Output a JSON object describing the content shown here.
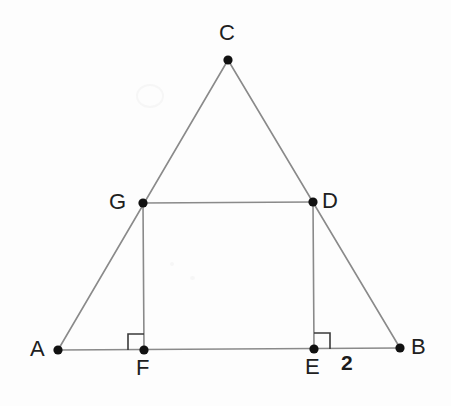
{
  "figure": {
    "canvas": {
      "width": 451,
      "height": 406
    },
    "background_color": "#fdfdfd",
    "line_color": "#8a8a8a",
    "marker_color": "#111111",
    "label_color": "#202020",
    "stroke_width": 1.6,
    "point_radius": 4.6
  },
  "points": [
    {
      "id": "A",
      "label": "A",
      "x": 58,
      "y": 350,
      "label_x": 30,
      "label_y": 338
    },
    {
      "id": "B",
      "label": "B",
      "x": 400,
      "y": 348,
      "label_x": 411,
      "label_y": 336
    },
    {
      "id": "C",
      "label": "C",
      "x": 228,
      "y": 60,
      "label_x": 219,
      "label_y": 22
    },
    {
      "id": "D",
      "label": "D",
      "x": 313,
      "y": 202,
      "label_x": 322,
      "label_y": 190
    },
    {
      "id": "E",
      "label": "E",
      "x": 314,
      "y": 349,
      "label_x": 305,
      "label_y": 356
    },
    {
      "id": "F",
      "label": "F",
      "x": 144,
      "y": 350,
      "label_x": 136,
      "label_y": 357
    },
    {
      "id": "G",
      "label": "G",
      "x": 143,
      "y": 203,
      "label_x": 109,
      "label_y": 191
    }
  ],
  "segments": [
    {
      "id": "AC",
      "from": "A",
      "to": "C",
      "name": "segment-ac"
    },
    {
      "id": "CB",
      "from": "C",
      "to": "B",
      "name": "segment-cb"
    },
    {
      "id": "AB",
      "from": "A",
      "to": "B",
      "name": "segment-ab"
    },
    {
      "id": "GD",
      "from": "G",
      "to": "D",
      "name": "segment-gd"
    },
    {
      "id": "GF",
      "from": "G",
      "to": "F",
      "name": "segment-gf"
    },
    {
      "id": "DE",
      "from": "D",
      "to": "E",
      "name": "segment-de"
    }
  ],
  "right_angle_marks": [
    {
      "id": "at-F",
      "vertex": "F",
      "size": 16,
      "dir_x": -1,
      "dir_y": -1,
      "name": "right-angle-mark-f"
    },
    {
      "id": "at-E",
      "vertex": "E",
      "size": 16,
      "dir_x": 1,
      "dir_y": -1,
      "name": "right-angle-mark-e"
    }
  ],
  "measurements": [
    {
      "id": "EB",
      "text": "2",
      "x": 341,
      "y": 352,
      "name": "length-label-eb"
    }
  ],
  "artifacts": [
    {
      "id": "watermark",
      "x": 136,
      "y": 84,
      "width": 24,
      "height": 20
    },
    {
      "id": "speck-1",
      "x": 170,
      "y": 262,
      "width": 4,
      "height": 4
    },
    {
      "id": "speck-2",
      "x": 190,
      "y": 276,
      "width": 5,
      "height": 4
    }
  ]
}
